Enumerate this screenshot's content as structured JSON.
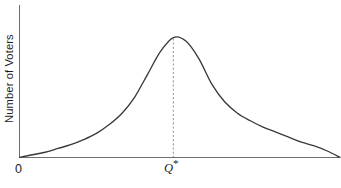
{
  "figure": {
    "background_color": "#ffffff",
    "curve_color": "#3a3a3a",
    "axis_color": "#6e6e6e",
    "guide_color": "#9a9a9a"
  },
  "labels": {
    "y_axis": "Number of Voters",
    "origin": "0",
    "peak_symbol": "Q",
    "peak_star": "*"
  },
  "chart_data": {
    "type": "line",
    "title": "",
    "subtitle": "",
    "xlabel": "",
    "ylabel": "Number of Voters",
    "grid": false,
    "legend": null,
    "xlim": [
      0,
      100
    ],
    "ylim": [
      0,
      100
    ],
    "xticks": [
      0,
      48
    ],
    "xticklabels": [
      "0",
      "Q*"
    ],
    "yticks": [],
    "yticklabels": [],
    "annotations": [
      {
        "text": "Q*",
        "type": "x-axis-marker",
        "x": 48,
        "note": "dashed vertical guide line from x-axis up to curve peak"
      }
    ],
    "series": [
      {
        "name": "Voter preference distribution",
        "x": [
          0,
          4,
          8,
          12,
          16,
          20,
          24,
          28,
          32,
          36,
          40,
          44,
          48,
          52,
          56,
          60,
          64,
          68,
          72,
          76,
          80,
          84,
          88,
          92,
          96,
          100
        ],
        "y": [
          0,
          2,
          4,
          7,
          10,
          14,
          19,
          26,
          35,
          48,
          66,
          84,
          95,
          92,
          78,
          58,
          44,
          35,
          29,
          24,
          20,
          16,
          12,
          9,
          5,
          0
        ]
      }
    ]
  }
}
